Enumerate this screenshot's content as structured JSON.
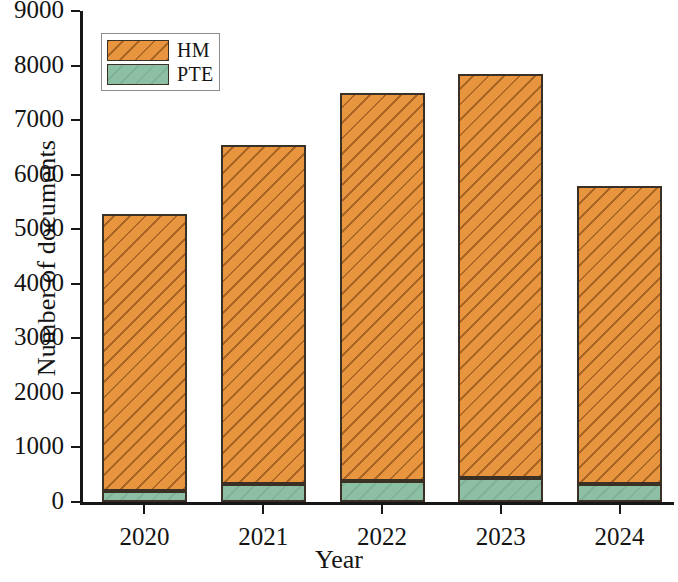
{
  "chart_data": {
    "type": "bar",
    "barmode": "stacked",
    "title": "",
    "subtitle": "",
    "xlabel": "Year",
    "ylabel": "Number of documents",
    "categories": [
      "2020",
      "2021",
      "2022",
      "2023",
      "2024"
    ],
    "series": [
      {
        "name": "PTE",
        "values": [
          200,
          330,
          385,
          440,
          330
        ],
        "color": "#8cbfa3"
      },
      {
        "name": "HM",
        "values": [
          5080,
          6220,
          7115,
          7410,
          5470
        ],
        "color": "#e8953f"
      }
    ],
    "stack_totals": [
      5280,
      6550,
      7500,
      7850,
      5800
    ],
    "ylim": [
      0,
      9000
    ],
    "ytick_labels": [
      "0",
      "1000",
      "2000",
      "3000",
      "4000",
      "5000",
      "6000",
      "7000",
      "8000",
      "9000"
    ],
    "ytick_values": [
      0,
      1000,
      2000,
      3000,
      4000,
      5000,
      6000,
      7000,
      8000,
      9000
    ],
    "grid": false,
    "legend_position": "top-left",
    "legend_entries": [
      "HM",
      "PTE"
    ],
    "annotations": []
  }
}
